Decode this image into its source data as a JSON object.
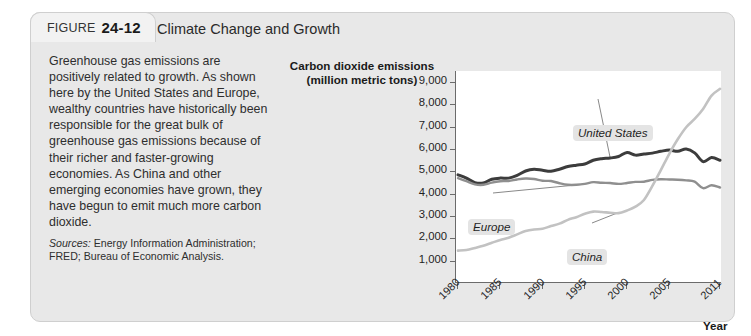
{
  "figure": {
    "label": "FIGURE",
    "number": "24-12",
    "title": "Climate Change and Growth"
  },
  "caption": {
    "body": "Greenhouse gas emissions are positively related to growth. As shown here by the United States and Europe, wealthy countries have historically been responsible for the great bulk of greenhouse gas emissions because of their richer and faster-growing economies. As China and other emerging economies have grown, they have begun to emit much more carbon dioxide.",
    "sources_label": "Sources:",
    "sources_value": " Energy Information Administration; FRED; Bureau of Economic Analysis."
  },
  "chart_data": {
    "type": "line",
    "title": "",
    "ylabel": "Carbon dioxide emissions (million metric tons)",
    "ylabel_line1": "Carbon dioxide emissions",
    "ylabel_line2": "(million metric tons)",
    "xlabel": "Year",
    "ylim": [
      0,
      9500
    ],
    "xlim": [
      1980,
      2011
    ],
    "yticks": [
      "9,000",
      "8,000",
      "7,000",
      "6,000",
      "5,000",
      "4,000",
      "3,000",
      "2,000",
      "1,000"
    ],
    "ytick_values": [
      9000,
      8000,
      7000,
      6000,
      5000,
      4000,
      3000,
      2000,
      1000
    ],
    "xticks": [
      "1980",
      "1985",
      "1990",
      "1995",
      "2000",
      "2005",
      "2011"
    ],
    "xtick_values": [
      1980,
      1985,
      1990,
      1995,
      2000,
      2005,
      2011
    ],
    "grid": false,
    "legend_position": "inline-annotations",
    "x": [
      1980,
      1981,
      1982,
      1983,
      1984,
      1985,
      1986,
      1987,
      1988,
      1989,
      1990,
      1991,
      1992,
      1993,
      1994,
      1995,
      1996,
      1997,
      1998,
      1999,
      2000,
      2001,
      2002,
      2003,
      2004,
      2005,
      2006,
      2007,
      2008,
      2009,
      2010,
      2011
    ],
    "series": [
      {
        "name": "United States",
        "color": "#3c3c3c",
        "width": 3.0,
        "values": [
          4850,
          4700,
          4500,
          4480,
          4650,
          4700,
          4700,
          4820,
          5020,
          5100,
          5050,
          5010,
          5100,
          5220,
          5280,
          5330,
          5500,
          5570,
          5600,
          5670,
          5850,
          5730,
          5780,
          5820,
          5900,
          5960,
          5900,
          6000,
          5830,
          5440,
          5620,
          5500
        ]
      },
      {
        "name": "Europe",
        "color": "#8f8f8f",
        "width": 2.4,
        "values": [
          4700,
          4560,
          4420,
          4400,
          4500,
          4560,
          4570,
          4640,
          4680,
          4660,
          4580,
          4570,
          4470,
          4400,
          4400,
          4440,
          4520,
          4490,
          4480,
          4440,
          4480,
          4530,
          4540,
          4620,
          4650,
          4640,
          4630,
          4600,
          4540,
          4250,
          4380,
          4280
        ]
      },
      {
        "name": "China",
        "color": "#c2c2c2",
        "width": 2.6,
        "values": [
          1450,
          1480,
          1570,
          1670,
          1800,
          1930,
          2030,
          2180,
          2330,
          2400,
          2430,
          2550,
          2660,
          2830,
          2950,
          3100,
          3200,
          3180,
          3150,
          3130,
          3250,
          3420,
          3720,
          4350,
          5060,
          5790,
          6440,
          6980,
          7350,
          7800,
          8400,
          8700
        ]
      }
    ],
    "annotations": [
      {
        "text": "United States",
        "series": "United States"
      },
      {
        "text": "Europe",
        "series": "Europe"
      },
      {
        "text": "China",
        "series": "China"
      }
    ]
  }
}
